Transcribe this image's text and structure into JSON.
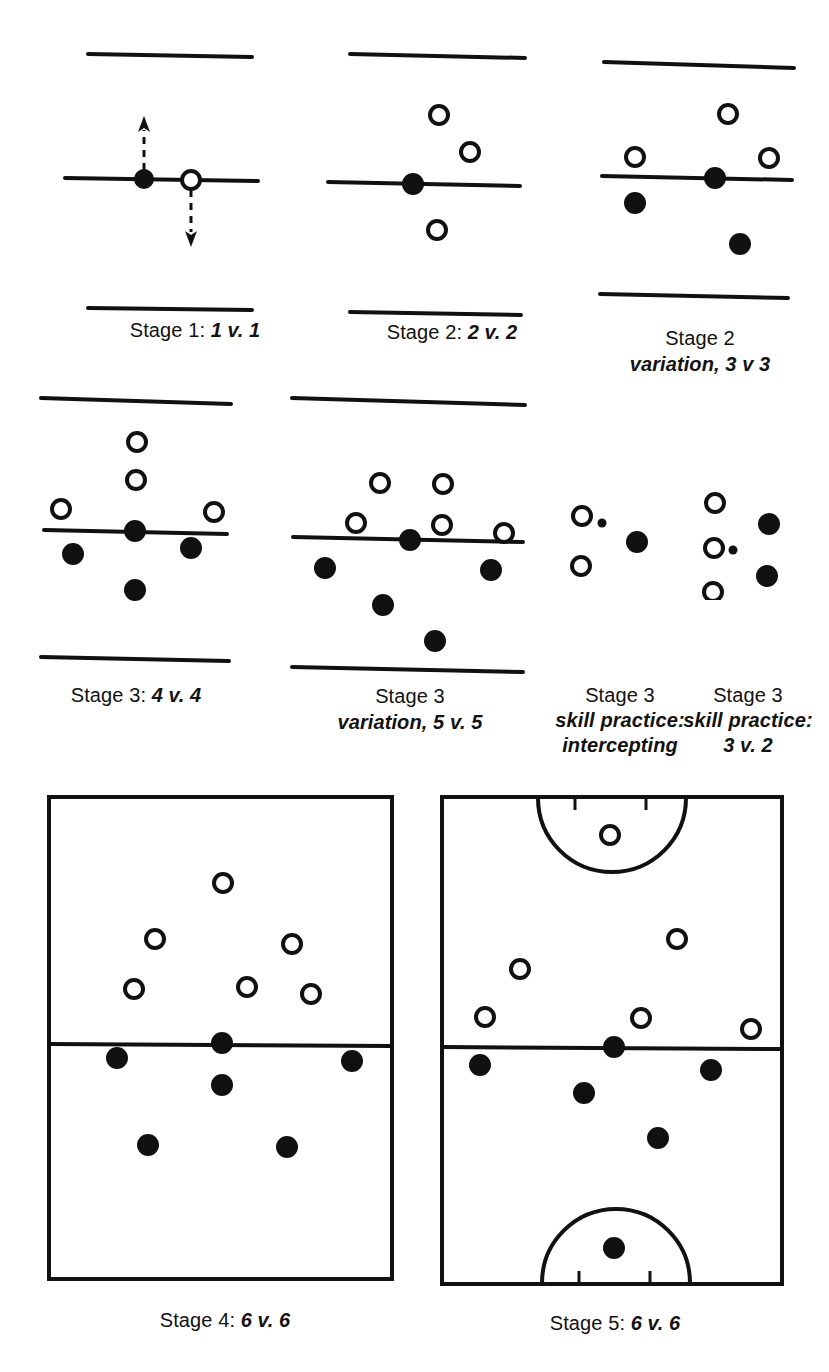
{
  "figure": {
    "sport": "netball",
    "ink_color": "#111111",
    "background_color": "#ffffff",
    "marker_legend": {
      "open_circle": "attacking player",
      "filled_circle": "defending player",
      "small_dot": "ball",
      "dashed_arrow": "direction of movement"
    }
  },
  "panels": [
    {
      "id": "stage1",
      "caption_lead": "Stage 1: ",
      "caption_em": "1 v. 1",
      "caption_lines": [
        "Stage 1: 1 v. 1"
      ],
      "type": "corridor",
      "open_circles": 1,
      "filled_circles": 1,
      "arrows": 2,
      "balls": 0
    },
    {
      "id": "stage2",
      "caption_lead": "Stage 2: ",
      "caption_em": "2 v. 2",
      "caption_lines": [
        "Stage 2: 2 v. 2"
      ],
      "type": "corridor",
      "open_circles": 3,
      "filled_circles": 1,
      "arrows": 0,
      "balls": 0
    },
    {
      "id": "stage2-variation",
      "caption_line1": "Stage 2",
      "caption_line2": "variation, 3 v 3",
      "caption_lines": [
        "Stage 2",
        "variation, 3 v 3"
      ],
      "type": "corridor",
      "open_circles": 3,
      "filled_circles": 3,
      "arrows": 0,
      "balls": 0
    },
    {
      "id": "stage3",
      "caption_lead": "Stage 3: ",
      "caption_em": "4 v. 4",
      "caption_lines": [
        "Stage 3: 4 v. 4"
      ],
      "type": "corridor",
      "open_circles": 4,
      "filled_circles": 4,
      "arrows": 0,
      "balls": 0
    },
    {
      "id": "stage3-variation",
      "caption_line1": "Stage 3",
      "caption_line2": "variation, 5 v. 5",
      "caption_lines": [
        "Stage 3",
        "variation, 5 v. 5"
      ],
      "type": "corridor",
      "open_circles": 5,
      "filled_circles": 5,
      "arrows": 0,
      "balls": 0
    },
    {
      "id": "stage3-intercepting",
      "caption_line1": "Stage 3",
      "caption_line2": "skill practice:",
      "caption_line3": "intercepting",
      "caption_lines": [
        "Stage 3",
        "skill practice:",
        "intercepting"
      ],
      "type": "free",
      "open_circles": 2,
      "filled_circles": 1,
      "arrows": 0,
      "balls": 1
    },
    {
      "id": "stage3-3v2",
      "caption_line1": "Stage 3",
      "caption_line2": "skill practice:",
      "caption_line3": "3 v. 2",
      "caption_lines": [
        "Stage 3",
        "skill practice:",
        "3 v. 2"
      ],
      "type": "free",
      "open_circles": 3,
      "filled_circles": 2,
      "arrows": 0,
      "balls": 1
    },
    {
      "id": "stage4",
      "caption_lead": "Stage 4: ",
      "caption_em": "6 v. 6",
      "caption_lines": [
        "Stage 4: 6 v. 6"
      ],
      "type": "court-plain",
      "open_circles": 6,
      "filled_circles": 6,
      "arrows": 0,
      "balls": 0
    },
    {
      "id": "stage5",
      "caption_lead": "Stage 5: ",
      "caption_em": "6 v. 6",
      "caption_lines": [
        "Stage 5: 6 v. 6"
      ],
      "type": "court-goal-circles",
      "open_circles": 6,
      "filled_circles": 6,
      "arrows": 0,
      "balls": 0
    }
  ]
}
